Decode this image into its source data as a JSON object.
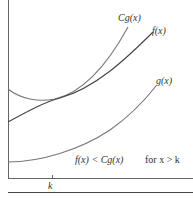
{
  "diagram": {
    "labels": {
      "cg": "Cg(x)",
      "f": "f(x)",
      "g": "g(x)",
      "inequality": "f(x) < Cg(x)",
      "condition": "for  x > k",
      "k": "k"
    },
    "colors": {
      "axis": "#555555",
      "cg_curve": "#777777",
      "f_curve": "#444444",
      "g_curve": "#777777"
    }
  }
}
